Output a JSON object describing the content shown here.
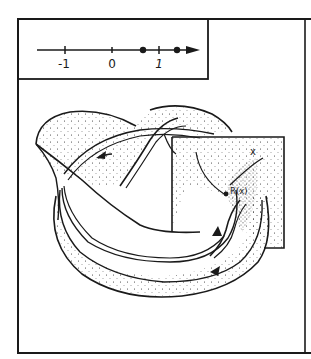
{
  "figure": {
    "number_line": {
      "tick_labels": [
        "-1",
        "0",
        "1"
      ],
      "points": [
        "dot-between-0-and-1",
        "dot-beyond-1"
      ]
    },
    "labels": {
      "point_x": "x",
      "point_rx": "R(x)"
    },
    "colors": {
      "ink": "#1a1a1a",
      "paper": "#ffffff"
    }
  }
}
